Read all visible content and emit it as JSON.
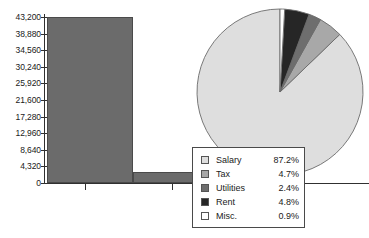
{
  "chart_data": [
    {
      "type": "bar",
      "title": "",
      "xlabel": "",
      "ylabel": "",
      "categories": [
        "Series 1",
        "Series 2"
      ],
      "values": [
        43200,
        2800
      ],
      "ylim": [
        0,
        43200
      ],
      "grid": false,
      "legend_position": "none",
      "bar_color": "#6b6b6b",
      "y_ticks": [
        {
          "value": 43200,
          "label": "43,200"
        },
        {
          "value": 38880,
          "label": "38,880"
        },
        {
          "value": 34560,
          "label": "34,560"
        },
        {
          "value": 30240,
          "label": "30,240"
        },
        {
          "value": 25920,
          "label": "25,920"
        },
        {
          "value": 21600,
          "label": "21,600"
        },
        {
          "value": 17280,
          "label": "17,280"
        },
        {
          "value": 12960,
          "label": "12,960"
        },
        {
          "value": 8640,
          "label": "8,640"
        },
        {
          "value": 4320,
          "label": "4,320"
        },
        {
          "value": 0,
          "label": "0"
        }
      ]
    },
    {
      "type": "pie",
      "title": "",
      "legend_position": "bottom-left",
      "start_angle_deg": 0,
      "direction": "counterclockwise",
      "labels": [
        "Salary",
        "Tax",
        "Utilities",
        "Rent",
        "Misc."
      ],
      "values": [
        87.2,
        4.7,
        2.4,
        4.8,
        0.9
      ],
      "value_labels": [
        "87.2%",
        "4.7%",
        "2.4%",
        "4.8%",
        "0.9%"
      ],
      "colors": [
        "#dedede",
        "#a8a8a8",
        "#6e6e6e",
        "#262626",
        "#ffffff"
      ]
    }
  ],
  "legend": {
    "rows": [
      {
        "label": "Salary",
        "value": "87.2%",
        "color": "#dedede"
      },
      {
        "label": "Tax",
        "value": "4.7%",
        "color": "#a8a8a8"
      },
      {
        "label": "Utilities",
        "value": "2.4%",
        "color": "#6e6e6e"
      },
      {
        "label": "Rent",
        "value": "4.8%",
        "color": "#262626"
      },
      {
        "label": "Misc.",
        "value": "0.9%",
        "color": "#ffffff"
      }
    ]
  }
}
